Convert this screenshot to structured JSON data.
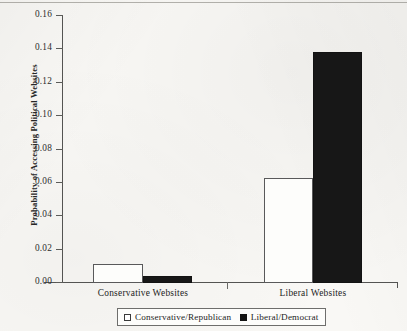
{
  "chart_data": {
    "type": "bar",
    "title": "",
    "subtitle": "",
    "xlabel": "",
    "ylabel": "Probability of Accessing Political Websites",
    "categories": [
      "Conservative Websites",
      "Liberal Websites"
    ],
    "series": [
      {
        "name": "Conservative/Republican",
        "color": "#ffffff",
        "edge_color": "#59595a",
        "values": [
          0.011,
          0.062
        ]
      },
      {
        "name": "Liberal/Democrat",
        "color": "#171717",
        "edge_color": "#121212",
        "values": [
          0.0035,
          0.138
        ]
      }
    ],
    "ylim": [
      0.0,
      0.16
    ],
    "ytick_labels": [
      "0.16",
      "0.14",
      "0.12",
      "0.10",
      "0.08",
      "0.06",
      "0.04",
      "0.02",
      "0.00"
    ],
    "ytick_values": [
      0.16,
      0.14,
      0.12,
      0.1,
      0.08,
      0.06,
      0.04,
      0.02,
      0.0
    ],
    "grid": false,
    "legend_position": "bottom-center",
    "legend_entries": [
      {
        "label": "Conservative/Republican",
        "swatch": "open-square"
      },
      {
        "label": "Liberal/Democrat",
        "swatch": "filled-square"
      }
    ]
  },
  "axis": {
    "y_title": "Probability of Accessing Political Websites",
    "ticks": [
      {
        "label": "0.16",
        "top": 15
      },
      {
        "label": "0.14",
        "top": 48
      },
      {
        "label": "0.12",
        "top": 82
      },
      {
        "label": "0.10",
        "top": 115
      },
      {
        "label": "0.08",
        "top": 149
      },
      {
        "label": "0.06",
        "top": 182
      },
      {
        "label": "0.04",
        "top": 215
      },
      {
        "label": "0.02",
        "top": 249
      },
      {
        "label": "0.00",
        "top": 282
      }
    ]
  },
  "bars": [
    {
      "name": "bar-conservative-websites-conservative-republican",
      "series": "Conservative/Republican",
      "category": "Conservative Websites",
      "value": 0.011,
      "style": "light",
      "left": 93,
      "width": 50,
      "top": 264,
      "height": 19
    },
    {
      "name": "bar-conservative-websites-liberal-democrat",
      "series": "Liberal/Democrat",
      "category": "Conservative Websites",
      "value": 0.0035,
      "style": "dark",
      "left": 143,
      "width": 49,
      "top": 276,
      "height": 7
    },
    {
      "name": "bar-liberal-websites-conservative-republican",
      "series": "Conservative/Republican",
      "category": "Liberal Websites",
      "value": 0.062,
      "style": "light",
      "left": 264,
      "width": 49,
      "top": 178,
      "height": 105
    },
    {
      "name": "bar-liberal-websites-liberal-democrat",
      "series": "Liberal/Democrat",
      "category": "Liberal Websites",
      "value": 0.138,
      "style": "dark",
      "left": 313,
      "width": 49,
      "top": 52,
      "height": 231
    }
  ],
  "category_labels": [
    {
      "label": "Conservative Websites",
      "left": 63,
      "width": 160
    },
    {
      "label": "Liberal Websites",
      "left": 243,
      "width": 140
    }
  ],
  "legend": {
    "items": [
      {
        "label": "Conservative/Republican",
        "swatch_style": "light"
      },
      {
        "label": "Liberal/Democrat",
        "swatch_style": "dark"
      }
    ]
  }
}
